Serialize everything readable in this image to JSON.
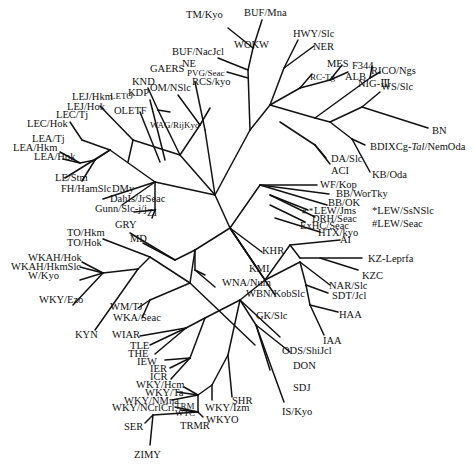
{
  "diagram": {
    "type": "unrooted phylogenetic tree",
    "line_color": "#111111",
    "background": "#ffffff"
  },
  "labels": {
    "tm_kyo": "TM/Kyo",
    "buf_mna": "BUF/Mna",
    "hwy_slc": "HWY/Slc",
    "ner": "NER",
    "wokw": "WOKW",
    "buf_nacjcl": "BUF/NacJcl",
    "ne": "NE",
    "gaers": "GAERS",
    "pvg_seac": "PVG/Seac",
    "rcs_kyo": "RCS/kyo",
    "mes": "MES",
    "f344": "F344",
    "rc_tg": "RC-Tg",
    "alb": "ALB",
    "rico_ngs": "RICO/Ngs",
    "nig3": "NIG-Ⅲ",
    "ws_slc": "WS/Slc",
    "bn": "BN",
    "bdix": "BDIXCg-",
    "bdix_tal": "Tal",
    "bdix_rest": "/NemOda",
    "kb_oda": "KB/Oda",
    "da_slc": "DA/Slc",
    "aci": "ACI",
    "knd": "KND",
    "kdp": "KDP",
    "om_nslc": "OM/NSlc",
    "lej_hkm": "LEJ/Hkm",
    "leto": "LETO",
    "lej_hok": "LEJ/Hok",
    "olETF": "OLETF",
    "wag_rijkyo": "WAG/RijKyo",
    "lec_tj": "LEC/Tj",
    "lec_hok": "LEC/Hok",
    "lea_tj": "LEA/Tj",
    "lea_hkm": "LEA/Hkm",
    "lea_hok": "LEA/Hok",
    "le_stm": "LE/Stm",
    "fh_hamslc": "FH/HamSlc",
    "dmy": "DMy",
    "dahls": "DahIs/JrSeac",
    "gunn": "Gunn/Slc-j/j",
    "zi": "ZI",
    "wf_kop": "WF/Kop",
    "bb_wortky": "BB/WorTky",
    "bb_ok": "BB/OK",
    "lew_jms": "LEW/Jms",
    "lew_marks": "# *",
    "drh_seac": "DRH/Seac",
    "exhc_seac": "ExHC/Seac",
    "htx_kyo": "HTX/kyo",
    "ai": "AI",
    "legend_star": "*LEW/SsNSlc",
    "legend_hash": "#LEW/Seac",
    "gry": "GRY",
    "md": "MD",
    "to_hkm": "TO/Hkm",
    "to_hok": "TO/Hok",
    "khr": "KHR",
    "kz_leprfa": "KZ-Leprfa",
    "kzc": "KZC",
    "kmi": "KMI",
    "wkah_hok": "WKAH/Hok",
    "wkah_hkmslc": "WKAH/HkmSlc",
    "w_kyo": "W/Kyo",
    "wna_num": "WNA/Num",
    "wbn_kobslc": "WBN/KobSlc",
    "nar_slc": "NAR/Slc",
    "sdt_jcl": "SDT/Jcl",
    "wky_ezo": "WKY/Ezo",
    "wm_tj": "WM/TJ",
    "wka_seac": "WKA/Seac",
    "gk_slc": "GK/Slc",
    "haa": "HAA",
    "kyn": "KYN",
    "wiar": "WIAR",
    "tle": "TLE",
    "the": "THE",
    "iaa": "IAA",
    "iew": "IEW",
    "ier": "IER",
    "icr": "ICR",
    "ods_shijcl": "ODS/ShiJcl",
    "don": "DON",
    "sdj": "SDJ",
    "wky_hcm": "WKY/Hcm",
    "wky_ta": "WKY/Ta",
    "wky_nmna": "WKY/NMna",
    "wky_ncrlcrl": "WKY/NCrlCrl",
    "trm": "TRM",
    "wtc": "WTC",
    "shr": "SHR",
    "wky_izm": "WKY/Izm",
    "wkyo": "WKYO",
    "is_kyo": "IS/Kyo",
    "ser": "SER",
    "trmr": "TRMR",
    "zimy": "ZIMY"
  }
}
